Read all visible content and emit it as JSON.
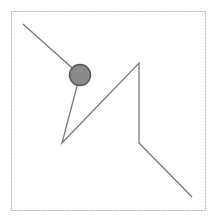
{
  "diagram": {
    "frame": {
      "x": 11,
      "y": 11,
      "width": 194,
      "height": 199,
      "stroke": "#b0b0b0",
      "dash": "2,1"
    },
    "path": {
      "points": [
        [
          23,
          24
        ],
        [
          80,
          75
        ],
        [
          62,
          143
        ],
        [
          139,
          63
        ],
        [
          139,
          143
        ],
        [
          192,
          197
        ]
      ],
      "stroke": "#777777",
      "width": 1.3
    },
    "node": {
      "cx": 80,
      "cy": 75,
      "r": 10.5,
      "fill": "#8a8a8a",
      "stroke": "#5a5a5a"
    }
  }
}
